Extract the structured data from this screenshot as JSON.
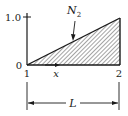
{
  "diagram": {
    "type": "shape-function-plot",
    "function_label": "N",
    "function_subscript": "2",
    "y_ticks": [
      {
        "label": "1.0",
        "value": 1.0
      },
      {
        "label": "0",
        "value": 0
      }
    ],
    "nodes": [
      {
        "label": "1",
        "position": "left"
      },
      {
        "label": "2",
        "position": "right"
      }
    ],
    "x_label": "x",
    "length_label": "L",
    "shape": {
      "start_value": 0,
      "end_value": 1.0,
      "fill": "hatched"
    },
    "colors": {
      "line": "#1a1a1a",
      "background": "#ffffff"
    }
  }
}
